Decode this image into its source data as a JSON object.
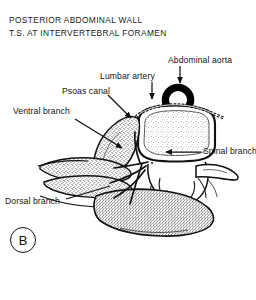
{
  "figure": {
    "title_line_1": "POSTERIOR ABDOMINAL WALL",
    "title_line_2": "T.S. AT INTERVERTEBRAL FORAMEN",
    "panel_letter": "B",
    "background_color": "#ffffff",
    "ink_color": "#111111"
  },
  "labels": {
    "abdominal_aorta": "Abdominal aorta",
    "lumbar_artery": "Lumbar artery",
    "psoas_canal": "Psoas canal",
    "ventral_branch": "Ventral branch",
    "spinal_branch": "Spinal branch",
    "dorsal_branch": "Dorsal branch"
  },
  "structures": [
    {
      "name": "abdominal-aorta",
      "kind": "vessel-lumen-ring"
    },
    {
      "name": "vertebral-body",
      "kind": "bone-cancellous"
    },
    {
      "name": "vertebral-arch",
      "kind": "bone-cortical"
    },
    {
      "name": "transverse-process",
      "kind": "bone-cortical"
    },
    {
      "name": "psoas-major-muscle",
      "kind": "muscle-stipple"
    },
    {
      "name": "quadratus-lumborum-muscle",
      "kind": "muscle-stipple"
    },
    {
      "name": "erector-spinae-muscle",
      "kind": "muscle-stipple"
    },
    {
      "name": "spinal-nerve",
      "kind": "nerve"
    },
    {
      "name": "lumbar-artery-trunk",
      "kind": "vessel-beaded"
    }
  ]
}
